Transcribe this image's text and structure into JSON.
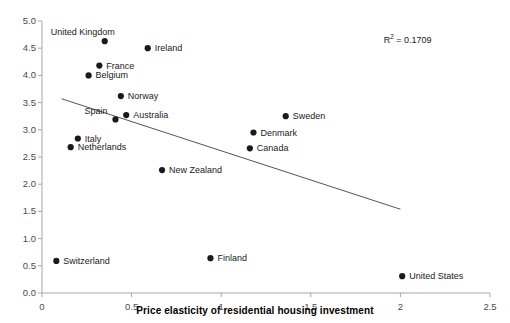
{
  "chart_data": {
    "type": "scatter",
    "title": "",
    "xlabel": "Price elasticity of residential housing investment",
    "ylabel": "",
    "xlim": [
      0,
      2.5
    ],
    "ylim": [
      0,
      5.0
    ],
    "xticks": [
      "0",
      "0.5",
      "1",
      "1.5",
      "2",
      "2.5"
    ],
    "xtick_values": [
      0,
      0.5,
      1,
      1.5,
      2,
      2.5
    ],
    "yticks": [
      "0.0",
      "0.5",
      "1.0",
      "1.5",
      "2.0",
      "2.5",
      "3.0",
      "3.5",
      "4.0",
      "4.5",
      "5.0"
    ],
    "ytick_values": [
      0,
      0.5,
      1,
      1.5,
      2,
      2.5,
      3,
      3.5,
      4,
      4.5,
      5
    ],
    "grid": false,
    "legend": "none",
    "marker_color": "#1a1a1a",
    "axis_color": "#a6a6a6",
    "trendline_color": "#404040",
    "annotations": [
      {
        "text_prefix": "R",
        "text_sup": "2",
        "text_suffix": " = 0.1709",
        "x": 2.13,
        "y": 4.68
      }
    ],
    "trendline": {
      "x1": 0.11,
      "y1": 3.57,
      "x2": 2.0,
      "y2": 1.54
    },
    "points": [
      {
        "label": "United Kingdom",
        "x": 0.35,
        "y": 4.63,
        "label_dx": -54,
        "label_dy": -13
      },
      {
        "label": "Ireland",
        "x": 0.59,
        "y": 4.5,
        "label_dx": 7,
        "label_dy": -4
      },
      {
        "label": "France",
        "x": 0.32,
        "y": 4.18,
        "label_dx": 7,
        "label_dy": -4
      },
      {
        "label": "Belgium",
        "x": 0.26,
        "y": 4.0,
        "label_dx": 7,
        "label_dy": -4
      },
      {
        "label": "Norway",
        "x": 0.44,
        "y": 3.62,
        "label_dx": 7,
        "label_dy": -4
      },
      {
        "label": "Australia",
        "x": 0.47,
        "y": 3.27,
        "label_dx": 7,
        "label_dy": -4
      },
      {
        "label": "Spain",
        "x": 0.41,
        "y": 3.19,
        "label_dx": -31,
        "label_dy": -12
      },
      {
        "label": "Sweden",
        "x": 1.36,
        "y": 3.25,
        "label_dx": 7,
        "label_dy": -4
      },
      {
        "label": "Denmark",
        "x": 1.18,
        "y": 2.95,
        "label_dx": 7,
        "label_dy": -4
      },
      {
        "label": "Italy",
        "x": 0.2,
        "y": 2.84,
        "label_dx": 7,
        "label_dy": -4
      },
      {
        "label": "Netherlands",
        "x": 0.16,
        "y": 2.68,
        "label_dx": 7,
        "label_dy": -4
      },
      {
        "label": "Canada",
        "x": 1.16,
        "y": 2.66,
        "label_dx": 7,
        "label_dy": -4
      },
      {
        "label": "New Zealand",
        "x": 0.67,
        "y": 2.26,
        "label_dx": 7,
        "label_dy": -4
      },
      {
        "label": "Finland",
        "x": 0.94,
        "y": 0.64,
        "label_dx": 7,
        "label_dy": -4
      },
      {
        "label": "Switzerland",
        "x": 0.08,
        "y": 0.59,
        "label_dx": 7,
        "label_dy": -4
      },
      {
        "label": "United States",
        "x": 2.01,
        "y": 0.31,
        "label_dx": 7,
        "label_dy": -4
      }
    ]
  }
}
